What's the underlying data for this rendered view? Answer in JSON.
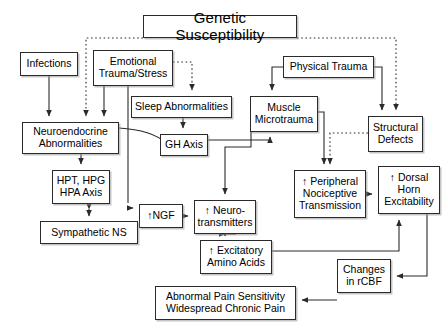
{
  "diagram": {
    "type": "flowchart",
    "canvas": {
      "width": 444,
      "height": 330
    },
    "style": {
      "box_border_color": "#2b2b2b",
      "box_fill_color": "#ffffff",
      "text_color": "#000000",
      "solid_edge_color": "#2b2b2b",
      "dotted_edge_color": "#2b2b2b",
      "shadow_color": "#969696"
    },
    "nodes": [
      {
        "id": "genetic",
        "label": "Genetic Susceptibility",
        "x": 143,
        "y": 15,
        "w": 154,
        "h": 23
      },
      {
        "id": "infections",
        "label": "Infections",
        "x": 20,
        "y": 52,
        "w": 58,
        "h": 24
      },
      {
        "id": "emotional",
        "label": "Emotional\nTrauma/Stress",
        "x": 93,
        "y": 50,
        "w": 80,
        "h": 36
      },
      {
        "id": "physical",
        "label": "Physical Trauma",
        "x": 283,
        "y": 56,
        "w": 91,
        "h": 22
      },
      {
        "id": "sleep",
        "label": "Sleep Abnormalities",
        "x": 131,
        "y": 96,
        "w": 101,
        "h": 22
      },
      {
        "id": "muscle",
        "label": "Muscle\nMicrotrauma",
        "x": 250,
        "y": 96,
        "w": 68,
        "h": 36
      },
      {
        "id": "structural",
        "label": "Structural\nDefects",
        "x": 368,
        "y": 116,
        "w": 55,
        "h": 36
      },
      {
        "id": "neuroendo",
        "label": "Neuroendocrine\nAbnormalities",
        "x": 22,
        "y": 122,
        "w": 97,
        "h": 32
      },
      {
        "id": "ghaxis",
        "label": "GH Axis",
        "x": 160,
        "y": 134,
        "w": 48,
        "h": 22
      },
      {
        "id": "hpt",
        "label": "HPT, HPG\nHPA Axis",
        "x": 52,
        "y": 170,
        "w": 58,
        "h": 34
      },
      {
        "id": "peripheral",
        "label": "↑ Peripheral\nNociceptive\nTransmission",
        "x": 294,
        "y": 170,
        "w": 72,
        "h": 48
      },
      {
        "id": "dorsal",
        "label": "↑ Dorsal\nHorn\nExcitability",
        "x": 378,
        "y": 166,
        "w": 62,
        "h": 48
      },
      {
        "id": "ngf",
        "label": "↑NGF",
        "x": 139,
        "y": 204,
        "w": 44,
        "h": 24
      },
      {
        "id": "neurotrans",
        "label": "↑ Neuro-\ntransmitters",
        "x": 194,
        "y": 200,
        "w": 62,
        "h": 34
      },
      {
        "id": "sympathetic",
        "label": "Sympathetic NS",
        "x": 40,
        "y": 221,
        "w": 98,
        "h": 23
      },
      {
        "id": "excitatory",
        "label": "↑ Excitatory\nAmino Acids",
        "x": 200,
        "y": 240,
        "w": 72,
        "h": 34
      },
      {
        "id": "rcbf",
        "label": "Changes\nin rCBF",
        "x": 337,
        "y": 259,
        "w": 54,
        "h": 34
      },
      {
        "id": "outcome",
        "label": "Abnormal Pain Sensitivity\nWidespread Chronic Pain",
        "x": 155,
        "y": 286,
        "w": 141,
        "h": 34
      }
    ],
    "edges": [
      {
        "from": "genetic",
        "to": "neuroendo",
        "style": "dotted"
      },
      {
        "from": "genetic",
        "to": "structural",
        "style": "dotted"
      },
      {
        "from": "emotional",
        "to": "sleep",
        "style": "dotted"
      },
      {
        "from": "structural",
        "to": "peripheral",
        "style": "dotted"
      },
      {
        "from": "infections",
        "to": "neuroendo",
        "style": "solid"
      },
      {
        "from": "emotional",
        "to": "neuroendo",
        "style": "solid"
      },
      {
        "from": "emotional",
        "to": "ghaxis",
        "style": "solid"
      },
      {
        "from": "physical",
        "to": "muscle",
        "style": "solid"
      },
      {
        "from": "physical",
        "to": "structural",
        "style": "solid"
      },
      {
        "from": "sleep",
        "to": "ghaxis",
        "style": "solid"
      },
      {
        "from": "neuroendo",
        "to": "ghaxis",
        "style": "solid"
      },
      {
        "from": "neuroendo",
        "to": "hpt",
        "style": "solid"
      },
      {
        "from": "neuroendo",
        "to": "ngf",
        "style": "solid"
      },
      {
        "from": "ghaxis",
        "to": "muscle",
        "style": "solid"
      },
      {
        "from": "muscle",
        "to": "neurotrans",
        "style": "solid"
      },
      {
        "from": "muscle",
        "to": "peripheral",
        "style": "solid"
      },
      {
        "from": "hpt",
        "to": "sympathetic",
        "style": "solid-bidirectional"
      },
      {
        "from": "ngf",
        "to": "neurotrans",
        "style": "solid"
      },
      {
        "from": "neurotrans",
        "to": "excitatory",
        "style": "solid"
      },
      {
        "from": "peripheral",
        "to": "dorsal",
        "style": "solid"
      },
      {
        "from": "excitatory",
        "to": "dorsal",
        "style": "solid"
      },
      {
        "from": "dorsal",
        "to": "rcbf",
        "style": "solid"
      },
      {
        "from": "rcbf",
        "to": "outcome",
        "style": "solid"
      }
    ]
  }
}
